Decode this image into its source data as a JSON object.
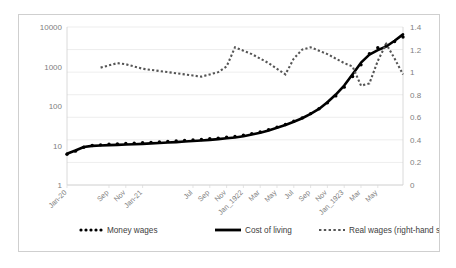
{
  "chart_data": {
    "type": "line",
    "title": "",
    "subtitle": "",
    "xlabel": "",
    "ylabel": "",
    "grid": true,
    "legend_position": "bottom",
    "left_axis": {
      "scale": "log",
      "ticks": [
        "1",
        "10",
        "100",
        "1000",
        "10000"
      ],
      "tick_values": [
        1,
        10,
        100,
        1000,
        10000
      ],
      "ylim": [
        1,
        10000
      ]
    },
    "right_axis": {
      "scale": "linear",
      "label": "Real wages (right-hand scale)",
      "ticks": [
        "0",
        "0.2",
        "0.4",
        "0.6",
        "0.8",
        "1",
        "1.2",
        "1.4"
      ],
      "tick_values": [
        0,
        0.2,
        0.4,
        0.6,
        0.8,
        1,
        1.2,
        1.4
      ],
      "ylim": [
        0,
        1.4
      ]
    },
    "x_tick_labels": [
      "Jan-20",
      "Sep",
      "Nov",
      "Jan-21",
      "Jul",
      "Sep",
      "Nov",
      "Jan_1922",
      "Mar",
      "May",
      "Jul",
      "Sep",
      "Nov",
      "Jan_1923",
      "Mar",
      "May"
    ],
    "x_tick_positions": [
      0,
      5,
      7,
      9,
      15,
      17,
      19,
      21,
      23,
      25,
      27,
      29,
      31,
      33,
      35,
      37
    ],
    "n_points": 41,
    "series": [
      {
        "name": "Money wages",
        "style": "dotted",
        "axis": "left",
        "color": "#000000",
        "values": [
          6.0,
          7.2,
          9.0,
          10.0,
          10.4,
          10.8,
          11.0,
          11.2,
          11.5,
          11.8,
          12.0,
          12.3,
          12.7,
          13.0,
          13.4,
          13.8,
          14.2,
          14.8,
          15.4,
          16.2,
          17.0,
          18.2,
          20.0,
          22.0,
          25.0,
          29.0,
          34.0,
          41.0,
          50.0,
          64.0,
          85.0,
          120.0,
          180.0,
          300.0,
          560.0,
          1100.0,
          2100.0,
          3000.0,
          3500.0,
          4300.0,
          5600.0
        ]
      },
      {
        "name": "Cost of living",
        "style": "solid",
        "axis": "left",
        "color": "#000000",
        "values": [
          6.2,
          7.5,
          9.2,
          9.8,
          10.0,
          10.2,
          10.4,
          10.6,
          10.8,
          11.0,
          11.3,
          11.6,
          11.9,
          12.2,
          12.6,
          13.0,
          13.4,
          13.9,
          14.5,
          15.2,
          16.0,
          17.2,
          19.0,
          21.0,
          24.0,
          28.0,
          33.0,
          40.0,
          49.0,
          63.0,
          84.0,
          125.0,
          195.0,
          330.0,
          640.0,
          1250.0,
          2000.0,
          2600.0,
          3200.0,
          4500.0,
          6500.0
        ]
      },
      {
        "name": "Real wages (right-hand scale)",
        "style": "dashed",
        "axis": "right",
        "color": "#555555",
        "values": [
          null,
          null,
          null,
          null,
          1.04,
          1.06,
          1.08,
          1.07,
          1.05,
          1.03,
          1.02,
          1.01,
          1.0,
          0.99,
          0.98,
          0.97,
          0.96,
          0.98,
          1.0,
          1.05,
          1.22,
          1.19,
          1.16,
          1.12,
          1.08,
          1.03,
          0.98,
          1.12,
          1.2,
          1.22,
          1.19,
          1.16,
          1.12,
          1.08,
          1.05,
          0.88,
          0.9,
          1.1,
          1.25,
          1.12,
          0.98
        ]
      }
    ],
    "legend": [
      {
        "label": "Money wages",
        "marker": "dotted"
      },
      {
        "label": "Cost of living",
        "marker": "solid"
      },
      {
        "label": "Real wages (right-hand scale)",
        "marker": "dashed"
      }
    ]
  }
}
